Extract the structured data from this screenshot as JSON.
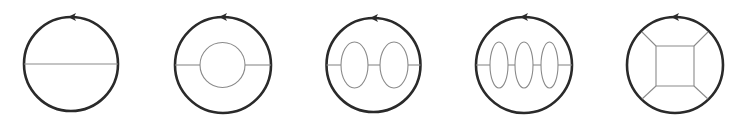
{
  "figure": {
    "colors": {
      "outer_stroke": "#2a2a2a",
      "inner_stroke": "#8a8a8a",
      "background": "#ffffff"
    },
    "panels": [
      {
        "id": "panel-1",
        "name": "single-chord",
        "outer": {
          "cx": 71,
          "cy": 64,
          "r": 47
        },
        "arrow": {
          "x": 73,
          "y": 17,
          "direction": "left"
        },
        "chords": [
          [
            24,
            64,
            118,
            64
          ]
        ],
        "ellipses": [],
        "polygon": null,
        "spokes": []
      },
      {
        "id": "panel-2",
        "name": "chord-with-inner-circle",
        "outer": {
          "cx": 223,
          "cy": 65,
          "r": 48
        },
        "arrow": {
          "x": 224,
          "y": 17,
          "direction": "left"
        },
        "chords": [
          [
            175,
            65,
            200,
            65
          ],
          [
            245,
            65,
            271,
            65
          ]
        ],
        "ellipses": [
          {
            "cx": 222.5,
            "cy": 65,
            "rx": 22.5,
            "ry": 22.5
          }
        ],
        "polygon": null,
        "spokes": []
      },
      {
        "id": "panel-3",
        "name": "two-ellipses-chain",
        "outer": {
          "cx": 373.5,
          "cy": 65,
          "r": 47
        },
        "arrow": {
          "x": 375,
          "y": 18,
          "direction": "left"
        },
        "chords": [
          [
            326.5,
            65,
            341,
            65
          ],
          [
            368,
            65,
            380,
            65
          ],
          [
            408,
            65,
            420.5,
            65
          ]
        ],
        "ellipses": [
          {
            "cx": 354.5,
            "cy": 65,
            "rx": 13.5,
            "ry": 23
          },
          {
            "cx": 394,
            "cy": 65,
            "rx": 14,
            "ry": 23
          }
        ],
        "polygon": null,
        "spokes": []
      },
      {
        "id": "panel-4",
        "name": "three-ellipses-chain",
        "outer": {
          "cx": 524,
          "cy": 65,
          "r": 48
        },
        "arrow": {
          "x": 525,
          "y": 17,
          "direction": "left"
        },
        "chords": [
          [
            476,
            65,
            490,
            65
          ],
          [
            508,
            65,
            515,
            65
          ],
          [
            533,
            65,
            541,
            65
          ],
          [
            558,
            65,
            572,
            65
          ]
        ],
        "ellipses": [
          {
            "cx": 499,
            "cy": 65,
            "rx": 9,
            "ry": 23
          },
          {
            "cx": 524,
            "cy": 65,
            "rx": 9,
            "ry": 23
          },
          {
            "cx": 549.5,
            "cy": 65,
            "rx": 8.5,
            "ry": 23
          }
        ],
        "polygon": null,
        "spokes": []
      },
      {
        "id": "panel-5",
        "name": "square-with-spokes",
        "outer": {
          "cx": 675,
          "cy": 65,
          "r": 48
        },
        "arrow": {
          "x": 676,
          "y": 17,
          "direction": "left"
        },
        "chords": [],
        "ellipses": [],
        "polygon": [
          [
            656,
            46
          ],
          [
            694,
            46
          ],
          [
            694,
            86
          ],
          [
            656,
            86
          ]
        ],
        "spokes": [
          [
            656,
            46,
            642,
            32
          ],
          [
            694,
            46,
            708,
            32
          ],
          [
            656,
            86,
            642,
            99
          ],
          [
            694,
            86,
            708,
            99
          ]
        ]
      }
    ]
  }
}
